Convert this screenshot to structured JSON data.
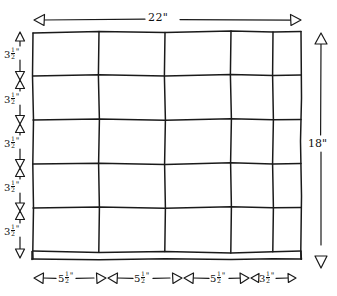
{
  "diagram": {
    "ink_color": "#1a1a1a",
    "background_color": "#ffffff",
    "overall_width_label": "22\"",
    "overall_height_label": "18\"",
    "grid": {
      "rows": 5,
      "columns": 5,
      "row_heights": [
        "3½\"",
        "3½\"",
        "3½\"",
        "3½\"",
        "3½\""
      ],
      "column_widths": [
        "5½\"",
        "5½\"",
        "5½\"",
        "3½\"",
        "remainder"
      ]
    },
    "left_dimensions": [
      {
        "whole": "3",
        "num": "1",
        "den": "2",
        "unit": "\"",
        "text": "3½\""
      },
      {
        "whole": "3",
        "num": "1",
        "den": "2",
        "unit": "\"",
        "text": "3½\""
      },
      {
        "whole": "3",
        "num": "1",
        "den": "2",
        "unit": "\"",
        "text": "3½\""
      },
      {
        "whole": "3",
        "num": "1",
        "den": "2",
        "unit": "\"",
        "text": "3½\""
      },
      {
        "whole": "3",
        "num": "1",
        "den": "2",
        "unit": "\"",
        "text": "3½\""
      }
    ],
    "bottom_dimensions": [
      {
        "whole": "5",
        "num": "1",
        "den": "2",
        "unit": "\"",
        "text": "5½\""
      },
      {
        "whole": "5",
        "num": "1",
        "den": "2",
        "unit": "\"",
        "text": "5½\""
      },
      {
        "whole": "5",
        "num": "1",
        "den": "2",
        "unit": "\"",
        "text": "5½\""
      },
      {
        "whole": "3",
        "num": "1",
        "den": "2",
        "unit": "\"",
        "text": "3½\""
      }
    ],
    "top_dimension": {
      "text": "22\"",
      "value": "22",
      "unit": "\""
    },
    "right_dimension": {
      "text": "18\"",
      "value": "18",
      "unit": "\""
    }
  }
}
